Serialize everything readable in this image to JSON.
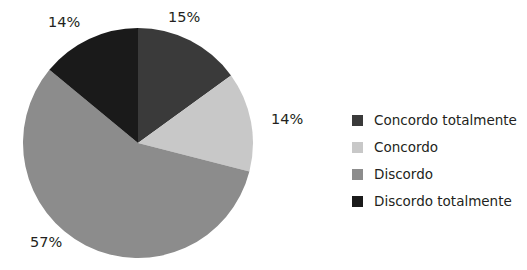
{
  "chart_data": {
    "type": "pie",
    "title": "",
    "categories": [
      "Concordo totalmente",
      "Concordo",
      "Discordo",
      "Discordo totalmente"
    ],
    "values": [
      15,
      14,
      57,
      14
    ],
    "value_labels": [
      "15%",
      "14%",
      "57%",
      "14%"
    ],
    "unit": "%",
    "colors": [
      "#3a3a3a",
      "#c8c8c8",
      "#8c8c8c",
      "#1a1a1a"
    ],
    "legend_position": "right",
    "grid": false,
    "start_angle_deg": 0,
    "direction": "clockwise",
    "slices": [
      {
        "label": "Concordo totalmente",
        "value": 15,
        "value_label": "15%",
        "color": "#3a3a3a"
      },
      {
        "label": "Concordo",
        "value": 14,
        "value_label": "14%",
        "color": "#c8c8c8"
      },
      {
        "label": "Discordo",
        "value": 57,
        "value_label": "57%",
        "color": "#8c8c8c"
      },
      {
        "label": "Discordo totalmente",
        "value": 14,
        "value_label": "14%",
        "color": "#1a1a1a"
      }
    ]
  },
  "legend": {
    "items": [
      {
        "label": "Concordo totalmente",
        "color": "#3a3a3a"
      },
      {
        "label": "Concordo",
        "color": "#c8c8c8"
      },
      {
        "label": "Discordo",
        "color": "#8c8c8c"
      },
      {
        "label": "Discordo totalmente",
        "color": "#1a1a1a"
      }
    ]
  }
}
